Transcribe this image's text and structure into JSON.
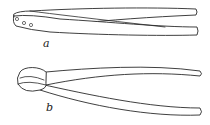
{
  "figure": {
    "items": [
      {
        "id": "a",
        "label": "a",
        "description": "Straight tongs with three rivet holes at the hinge end"
      },
      {
        "id": "b",
        "label": "b",
        "description": "Tongs with a looped/ring head"
      }
    ],
    "colors": {
      "line": "#2a2a2a",
      "background": "#ffffff"
    }
  }
}
